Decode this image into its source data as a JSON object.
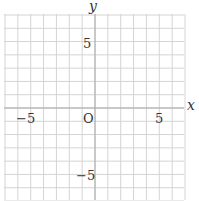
{
  "chart_data": {
    "type": "line",
    "title": "",
    "xlabel": "x",
    "ylabel": "y",
    "xlim": [
      -7,
      7
    ],
    "ylim": [
      -7,
      7
    ],
    "grid": true,
    "grid_step": 1,
    "x_ticks_labeled": [
      -5,
      5
    ],
    "y_ticks_labeled": [
      5,
      -5
    ],
    "origin_label": "O",
    "series": []
  },
  "labels": {
    "x_axis": "x",
    "y_axis": "y",
    "origin": "O",
    "x_neg5": "−5",
    "x_pos5": "5",
    "y_pos5": "5",
    "y_neg5": "−5"
  },
  "colors": {
    "grid": "#d4d4d4",
    "axis": "#a8a8a8",
    "text": "#333333"
  }
}
